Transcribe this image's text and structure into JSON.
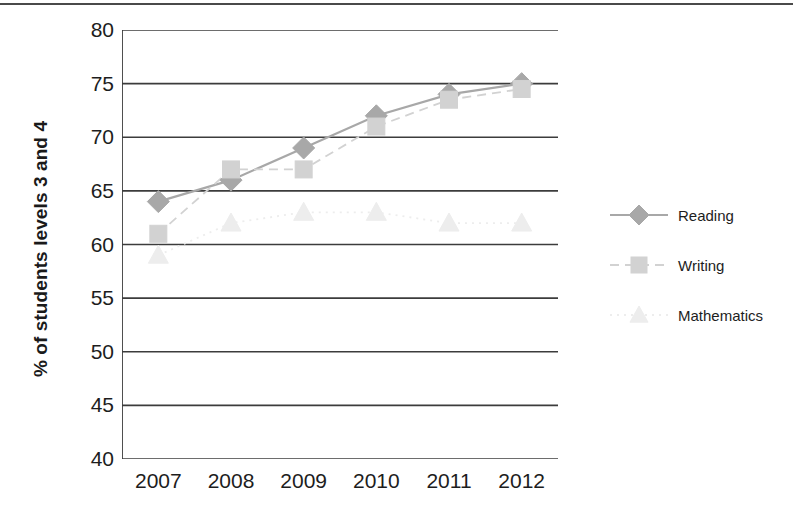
{
  "chart_data": {
    "type": "line",
    "title": "",
    "subtitle": "",
    "xlabel": "",
    "ylabel": "% of students levels 3 and 4",
    "categories": [
      "2007",
      "2008",
      "2009",
      "2010",
      "2011",
      "2012"
    ],
    "x": [
      2007,
      2008,
      2009,
      2010,
      2011,
      2012
    ],
    "ylim": [
      40,
      80
    ],
    "yticks": [
      80,
      75,
      70,
      65,
      60,
      55,
      50,
      45,
      40
    ],
    "ytick_labels": [
      "80",
      "75",
      "70",
      "65",
      "60",
      "55",
      "50",
      "45",
      "40"
    ],
    "grid": true,
    "grid_axis": "y",
    "legend_position": "right",
    "series": [
      {
        "name": "Reading",
        "marker": "diamond",
        "line_style": "solid",
        "color": "#a8a8a8",
        "values": [
          64,
          66,
          69,
          72,
          74,
          75
        ]
      },
      {
        "name": "Writing",
        "marker": "square",
        "line_style": "dashed",
        "color": "#d2d2d2",
        "values": [
          61,
          67,
          67,
          71,
          73.5,
          74.5
        ]
      },
      {
        "name": "Mathematics",
        "marker": "triangle",
        "line_style": "dotted",
        "color": "#ededed",
        "values": [
          59,
          62,
          63,
          63,
          62,
          62
        ]
      }
    ]
  },
  "axes": {
    "y_title": "% of students levels 3 and 4"
  },
  "legend": {
    "items": [
      {
        "label": "Reading"
      },
      {
        "label": "Writing"
      },
      {
        "label": "Mathematics"
      }
    ]
  }
}
